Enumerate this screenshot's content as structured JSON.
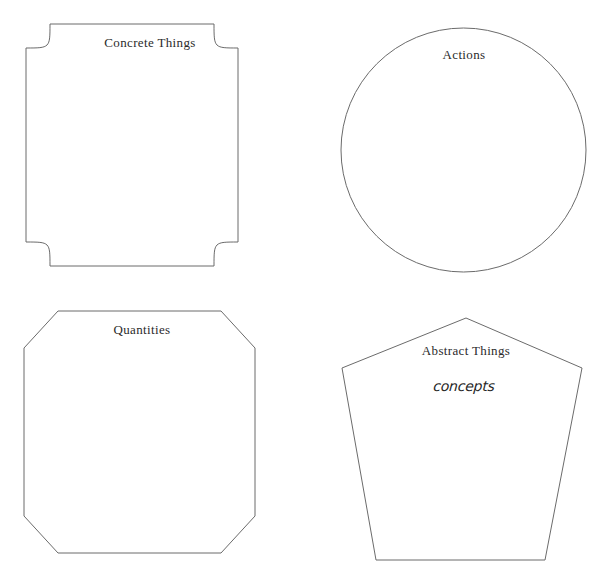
{
  "figure": {
    "width": 602,
    "height": 581,
    "background_color": "#ffffff",
    "stroke_color": "#6b6b6b",
    "label_color": "#2b2b2b"
  },
  "shapes": [
    {
      "id": "concrete-things",
      "label": "Concrete Things",
      "shape_kind": "square-concave-corners",
      "label_x": 150,
      "label_y": 36,
      "bounds": {
        "x": 26,
        "y": 24,
        "width": 212,
        "height": 242
      }
    },
    {
      "id": "actions",
      "label": "Actions",
      "shape_kind": "circle",
      "label_x": 464,
      "label_y": 48,
      "bounds": {
        "x": 341,
        "y": 28,
        "width": 245,
        "height": 244
      }
    },
    {
      "id": "quantities",
      "label": "Quantities",
      "shape_kind": "octagon",
      "label_x": 142,
      "label_y": 323,
      "bounds": {
        "x": 24,
        "y": 311,
        "width": 231,
        "height": 242
      }
    },
    {
      "id": "abstract-things",
      "label": "Abstract Things",
      "annotation": "concepts",
      "shape_kind": "pentagon",
      "label_x": 466,
      "label_y": 344,
      "annotation_x": 464,
      "annotation_y": 379,
      "bounds": {
        "x": 342,
        "y": 318,
        "width": 240,
        "height": 242
      }
    }
  ]
}
